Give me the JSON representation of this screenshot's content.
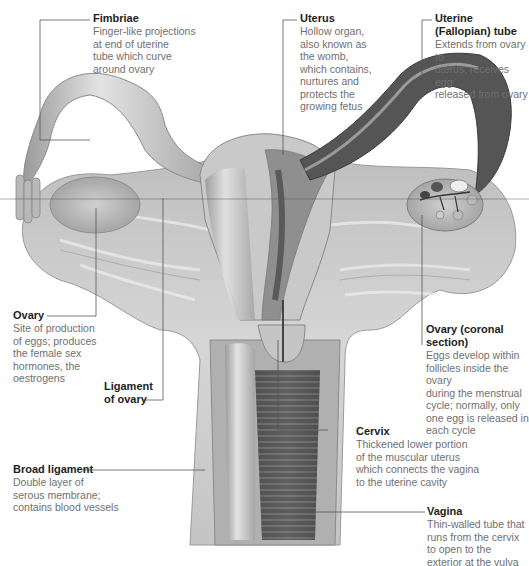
{
  "diagram": {
    "colors": {
      "text_title": "#1d1d1d",
      "text_body": "#6f6f6f",
      "leader_line": "#555555",
      "tissue_light": "#d9d9d9",
      "tissue_mid": "#a8a8a8",
      "tissue_dark": "#4a4a4a"
    },
    "labels": [
      {
        "id": "fimbriae",
        "title": "Fimbriae",
        "text": "Finger-like projections\nat end of uterine\ntube which curve\naround ovary"
      },
      {
        "id": "uterus",
        "title": "Uterus",
        "text": "Hollow organ,\nalso known as\nthe womb,\nwhich contains,\nnurtures and\nprotects the\ngrowing fetus"
      },
      {
        "id": "uterine_tube",
        "title": "Uterine\n(Fallopian) tube",
        "text": "Extends from ovary to\nuterus; receives egg\nreleased from ovary"
      },
      {
        "id": "ovary",
        "title": "Ovary",
        "text": "Site of production\nof eggs; produces\nthe female sex\nhormones, the\noestrogens"
      },
      {
        "id": "ligament_of_ovary",
        "title": "Ligament\nof ovary",
        "text": ""
      },
      {
        "id": "ovary_coronal",
        "title": "Ovary (coronal\nsection)",
        "text": "Eggs develop within\nfollicles inside the ovary\nduring the menstrual\ncycle; normally, only\none egg is released in\neach cycle"
      },
      {
        "id": "broad_ligament",
        "title": "Broad ligament",
        "text": "Double layer of\nserous membrane;\ncontains blood vessels"
      },
      {
        "id": "cervix",
        "title": "Cervix",
        "text": "Thickened lower portion\nof the muscular uterus\nwhich connects the vagina\nto the uterine cavity"
      },
      {
        "id": "vagina",
        "title": "Vagina",
        "text": "Thin-walled tube that\nruns from the cervix\nto open to the\nexterior at the vulva"
      }
    ]
  }
}
